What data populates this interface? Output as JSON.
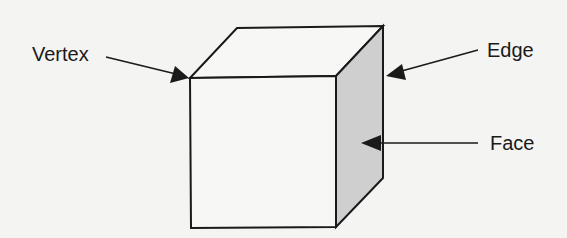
{
  "diagram": {
    "labels": {
      "vertex": "Vertex",
      "edge": "Edge",
      "face": "Face"
    },
    "colors": {
      "background": "#f4f4f2",
      "stroke": "#1a1a1a",
      "shaded_face": "#cfcfcf",
      "front_face": "#f7f7f5",
      "top_face": "#f7f7f5"
    }
  }
}
